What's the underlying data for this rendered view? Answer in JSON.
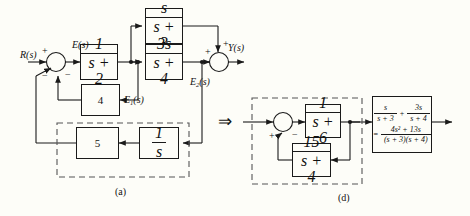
{
  "figure": {
    "title_a": "(a)",
    "title_d": "(d)",
    "transform_arrow": "⇒"
  },
  "diagram_a": {
    "caption": "(a)",
    "signals": {
      "input": "R(s)",
      "error": "E(s)",
      "e1": "E₁(s)",
      "e2": "E₂(s)",
      "output": "Y(s)"
    },
    "sum1": {
      "name": "summing-junction-left",
      "signs": [
        "+",
        "−",
        "−"
      ]
    },
    "sum2": {
      "name": "summing-junction-right",
      "signs": [
        "+",
        "+"
      ]
    },
    "blocks": [
      {
        "id": "g-forward",
        "num": "1",
        "den": "s + 2",
        "type": "fraction"
      },
      {
        "id": "g-upper",
        "num": "s",
        "den": "s + 3",
        "type": "fraction"
      },
      {
        "id": "g-lower",
        "num": "3s",
        "den": "s + 4",
        "type": "fraction"
      },
      {
        "id": "h-gain-4",
        "value": "4",
        "type": "gain"
      },
      {
        "id": "h-gain-5",
        "value": "5",
        "type": "gain"
      },
      {
        "id": "h-integrator",
        "num": "1",
        "den": "s",
        "type": "fraction"
      }
    ]
  },
  "diagram_d": {
    "caption": "(d)",
    "sum": {
      "name": "summing-junction",
      "signs": [
        "+",
        "−"
      ]
    },
    "blocks": [
      {
        "id": "g-forward",
        "num": "1",
        "den": "s + 6",
        "type": "fraction"
      },
      {
        "id": "h-feedback",
        "num": "15",
        "den": "s + 4",
        "type": "fraction"
      }
    ],
    "result_block": {
      "id": "combined-transfer-function",
      "line1_term1_num": "s",
      "line1_term1_den": "s + 3",
      "line1_operator": "+",
      "line1_term2_num": "3s",
      "line1_term2_den": "s + 4",
      "line2_equals": "=",
      "line2_num": "4s² + 13s",
      "line2_den": "(s + 3)(s + 4)"
    }
  },
  "colors": {
    "line": "#1a1a1a",
    "background": "#fdfdf8",
    "dashed": "#555555"
  }
}
